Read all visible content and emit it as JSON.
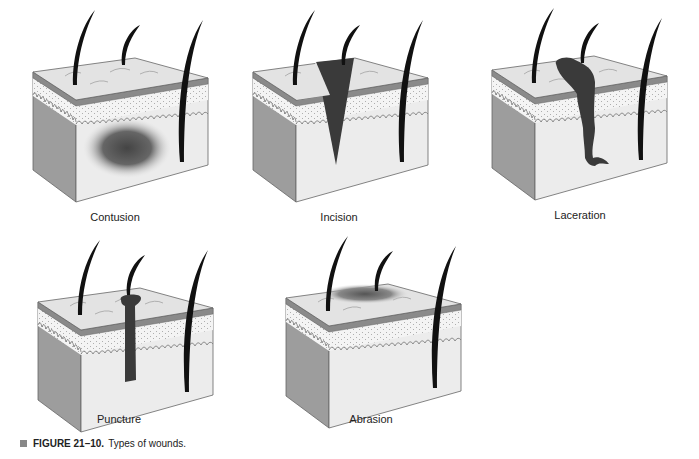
{
  "figure": {
    "number": "FIGURE 21–10.",
    "title": "Types of wounds.",
    "bullet_color": "#888888"
  },
  "panels": [
    {
      "id": "contusion",
      "label": "Contusion",
      "x": 0,
      "y": 0
    },
    {
      "id": "incision",
      "label": "Incision",
      "x": 220,
      "y": 0
    },
    {
      "id": "laceration",
      "label": "Laceration",
      "x": 459,
      "y": -2
    },
    {
      "id": "puncture",
      "label": "Puncture",
      "x": 5,
      "y": 230
    },
    {
      "id": "abrasion",
      "label": "Abrasion",
      "x": 253,
      "y": 226
    }
  ],
  "colors": {
    "top_surface": "#e3e3e3",
    "epidermis_band": "#8a8a8a",
    "dermis": "#f2f2f2",
    "front_face": "#ececec",
    "side_face": "#9a9a9a",
    "wound": "#3a3a3a",
    "hair": "#111111"
  }
}
